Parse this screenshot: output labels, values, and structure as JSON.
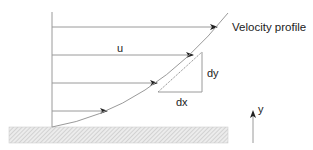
{
  "diagram": {
    "title_label": "Velocity profile",
    "velocity_label": "u",
    "dy_label": "dy",
    "dx_label": "dx",
    "y_axis_label": "y",
    "colors": {
      "line": "#9a9a9a",
      "arrowhead": "#222222",
      "text": "#222222",
      "wall_fill": "#e6e6e6",
      "wall_hatch": "#b5b5b5"
    },
    "velocity_arrows": [
      {
        "y": 27,
        "x_end": 217
      },
      {
        "y": 55,
        "x_end": 193
      },
      {
        "y": 83,
        "x_end": 157
      },
      {
        "y": 111,
        "x_end": 107
      }
    ]
  }
}
